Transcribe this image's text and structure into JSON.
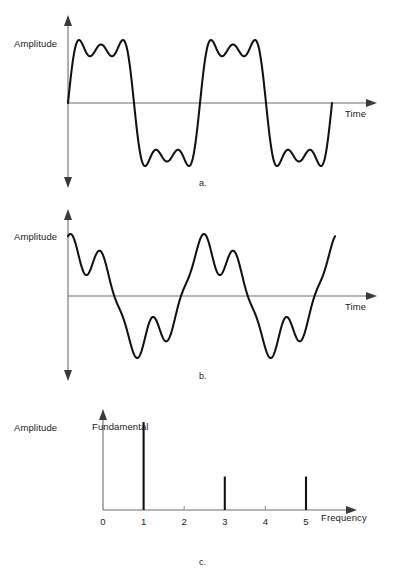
{
  "panels": [
    {
      "id": "a",
      "caption": "a.",
      "y_axis_label": "Amplitude",
      "x_axis_label": "Time",
      "x_arrow": "arrow-right",
      "y_arrow": "arrow-up-down"
    },
    {
      "id": "b",
      "caption": "b.",
      "y_axis_label": "Amplitude",
      "x_axis_label": "Time",
      "x_arrow": "arrow-right",
      "y_arrow": "arrow-up-down"
    },
    {
      "id": "c",
      "caption": "c.",
      "y_axis_label": "Amplitude",
      "x_axis_label": "Frequency",
      "annotation": "Fundamental",
      "x_arrow": "arrow-right",
      "y_arrow": "arrow-up"
    }
  ],
  "chart_data": [
    {
      "type": "line",
      "id": "panel-a-waveform",
      "title": "",
      "xlabel": "Time",
      "ylabel": "Amplitude",
      "description": "Square-wave approximation: sin(t) + (1/3)sin(3t) + (1/5)sin(5t), in-phase harmonics",
      "grid": false,
      "xlim": [
        0,
        4.2
      ],
      "ylim": [
        -1.2,
        1.2
      ],
      "series": [
        {
          "name": "sum of odd harmonics (in phase)",
          "formula": "sin(t) + sin(3t)/3 + sin(5t)/5",
          "harmonics": [
            {
              "order": 1,
              "amplitude": 1.0,
              "phase": 0
            },
            {
              "order": 3,
              "amplitude": 0.3333,
              "phase": 0
            },
            {
              "order": 5,
              "amplitude": 0.2,
              "phase": 0
            }
          ],
          "cycles": 2
        }
      ]
    },
    {
      "type": "line",
      "id": "panel-b-waveform",
      "title": "",
      "xlabel": "Time",
      "ylabel": "Amplitude",
      "description": "Same harmonic amplitudes as panel a but with shifted phases, producing a different wave shape",
      "grid": false,
      "xlim": [
        0,
        4.2
      ],
      "ylim": [
        -1.2,
        1.2
      ],
      "series": [
        {
          "name": "sum of odd harmonics (phase shifted)",
          "formula": "sin(t + 1.0) + sin(3t + 2.2)/3 + sin(5t + 0.6)/5",
          "harmonics": [
            {
              "order": 1,
              "amplitude": 1.0,
              "phase": 1.0
            },
            {
              "order": 3,
              "amplitude": 0.3333,
              "phase": 2.2
            },
            {
              "order": 5,
              "amplitude": 0.2,
              "phase": 0.6
            }
          ],
          "cycles": 2
        }
      ]
    },
    {
      "type": "bar",
      "id": "panel-c-spectrum",
      "title": "",
      "xlabel": "Frequency",
      "ylabel": "Amplitude",
      "grid": false,
      "categories": [
        "0",
        "1",
        "2",
        "3",
        "4",
        "5"
      ],
      "tick_labels": [
        "0",
        "1",
        "2",
        "3",
        "4",
        "5"
      ],
      "xlim": [
        0,
        5.9
      ],
      "ylim": [
        0,
        1.0
      ],
      "values": [
        0,
        1.0,
        0,
        0.38,
        0,
        0.38
      ],
      "annotations": [
        {
          "text": "Fundamental",
          "at_x": 1,
          "at_y": 1.0
        }
      ]
    }
  ]
}
